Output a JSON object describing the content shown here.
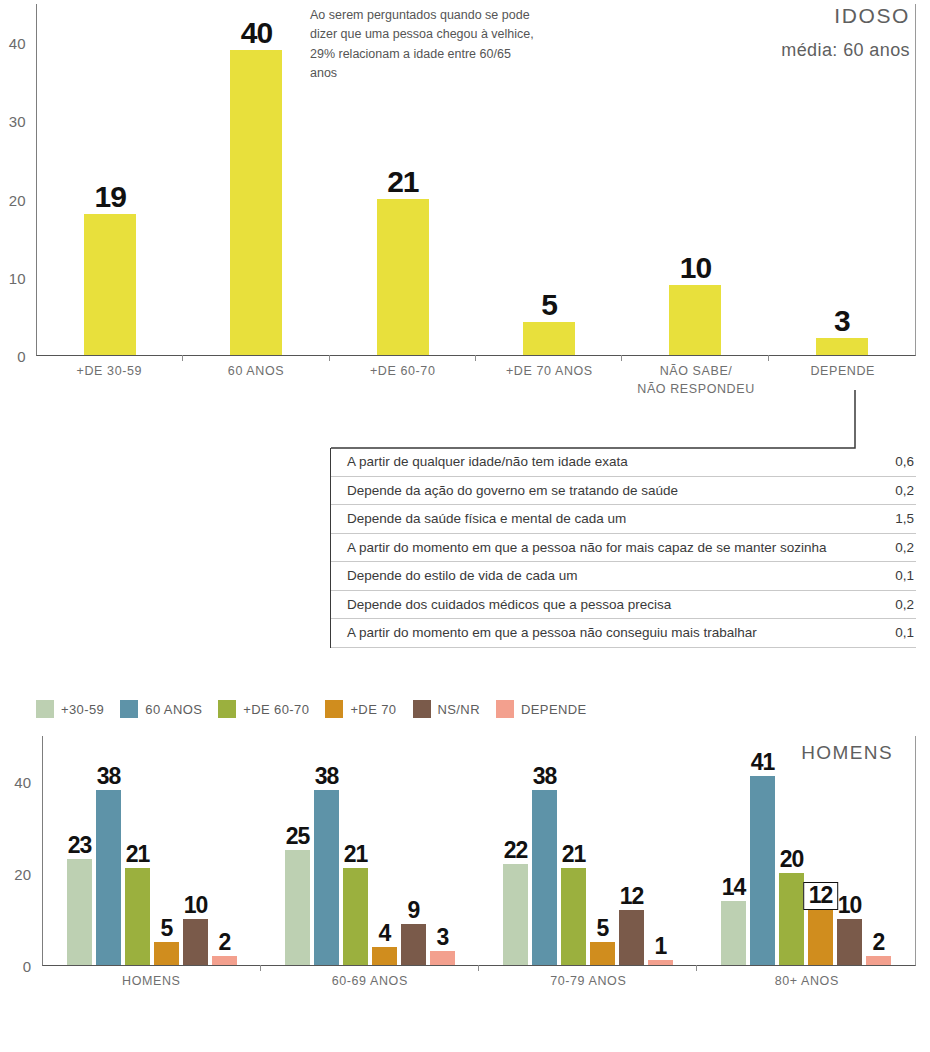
{
  "top": {
    "title": "IDOSO",
    "subtitle": "média: 60 anos",
    "note": "Ao serem perguntados quando se pode dizer que uma pessoa chegou à velhice, 29% relacionam a idade entre 60/65 anos"
  },
  "bottom": {
    "title": "HOMENS"
  },
  "table": {
    "rows": [
      {
        "label": "A partir de qualquer idade/não tem idade exata",
        "value": "0,6"
      },
      {
        "label": "Depende da ação do governo em se tratando de saúde",
        "value": "0,2"
      },
      {
        "label": "Depende da saúde física e mental de cada um",
        "value": "1,5"
      },
      {
        "label": "A partir do momento em que a pessoa não for mais capaz de se manter sozinha",
        "value": "0,2"
      },
      {
        "label": "Depende do estilo de vida de cada um",
        "value": "0,1"
      },
      {
        "label": "Depende dos cuidados médicos que a pessoa precisa",
        "value": "0,2"
      },
      {
        "label": "A partir do momento em que a pessoa não conseguiu mais trabalhar",
        "value": "0,1"
      }
    ]
  },
  "legend": {
    "items": [
      {
        "label": "+30-59",
        "color": "#bdd0b2"
      },
      {
        "label": "60 ANOS",
        "color": "#5e93a8"
      },
      {
        "label": "+DE 60-70",
        "color": "#9bb03e"
      },
      {
        "label": "+DE 70",
        "color": "#d08d1e"
      },
      {
        "label": "NS/NR",
        "color": "#7a5a4a"
      },
      {
        "label": "DEPENDE",
        "color": "#f3a08e"
      }
    ]
  },
  "chart_data": [
    {
      "type": "bar",
      "id": "idoso-idade-velhice",
      "title": "IDOSO",
      "subtitle": "média: 60 anos",
      "xlabel": "",
      "ylabel": "",
      "ylim": [
        0,
        45
      ],
      "yticks": [
        0,
        10,
        20,
        30,
        40
      ],
      "grid": false,
      "color": "#e8e03c",
      "categories": [
        "+DE 30-59",
        "60 ANOS",
        "+DE 60-70",
        "+DE 70 ANOS",
        "NÃO SABE/\nNÃO RESPONDEU",
        "DEPENDE"
      ],
      "categories_display": [
        [
          "+DE 30-59"
        ],
        [
          "60 ANOS"
        ],
        [
          "+DE 60-70"
        ],
        [
          "+DE 70 ANOS"
        ],
        [
          "NÃO SABE/",
          "NÃO RESPONDEU"
        ],
        [
          "DEPENDE"
        ]
      ],
      "values": [
        19,
        40,
        21,
        5,
        10,
        3
      ],
      "bar_heights": [
        18,
        39,
        20,
        4.2,
        9,
        2.2
      ],
      "annotation": "Ao serem perguntados quando se pode dizer que uma pessoa chegou à velhice, 29% relacionam a idade entre 60/65 anos"
    },
    {
      "type": "bar",
      "id": "homens-por-faixa-etaria",
      "title": "HOMENS",
      "xlabel": "",
      "ylabel": "",
      "ylim": [
        0,
        50
      ],
      "yticks": [
        0,
        20,
        40
      ],
      "grid": false,
      "legend_position": "top-left",
      "categories": [
        "HOMENS",
        "60-69 ANOS",
        "70-79 ANOS",
        "80+ ANOS"
      ],
      "series": [
        {
          "name": "+30-59",
          "color": "#bdd0b2",
          "values": [
            23,
            25,
            22,
            14
          ]
        },
        {
          "name": "60 ANOS",
          "color": "#5e93a8",
          "values": [
            38,
            38,
            38,
            41
          ]
        },
        {
          "name": "+DE 60-70",
          "color": "#9bb03e",
          "values": [
            21,
            21,
            21,
            20
          ]
        },
        {
          "name": "+DE 70",
          "color": "#d08d1e",
          "values": [
            5,
            4,
            5,
            12
          ]
        },
        {
          "name": "NS/NR",
          "color": "#7a5a4a",
          "values": [
            10,
            9,
            12,
            10
          ]
        },
        {
          "name": "DEPENDE",
          "color": "#f3a08e",
          "values": [
            2,
            3,
            1,
            2
          ]
        }
      ],
      "highlighted": {
        "group": "80+ ANOS",
        "series": "+DE 70",
        "value": 12
      }
    },
    {
      "type": "table",
      "id": "depende-breakdown",
      "columns": [
        "",
        ""
      ],
      "rows": [
        [
          "A partir de qualquer idade/não tem idade exata",
          "0,6"
        ],
        [
          "Depende da ação do governo em se tratando de saúde",
          "0,2"
        ],
        [
          "Depende da saúde física e mental de cada um",
          "1,5"
        ],
        [
          "A partir do momento em que a pessoa não for mais capaz de se manter sozinha",
          "0,2"
        ],
        [
          "Depende do estilo de vida de cada um",
          "0,1"
        ],
        [
          "Depende dos cuidados médicos que a pessoa precisa",
          "0,2"
        ],
        [
          "A partir do momento em que a pessoa não conseguiu mais trabalhar",
          "0,1"
        ]
      ]
    }
  ]
}
